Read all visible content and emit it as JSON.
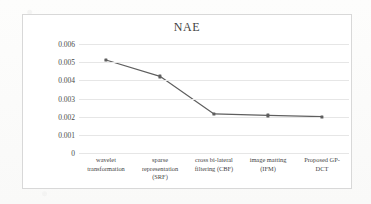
{
  "chart_data": {
    "type": "line",
    "title": "NAE",
    "xlabel": "",
    "ylabel": "",
    "categories": [
      "wavelet transformation",
      "sparse representation (SRF)",
      "cross bi-lateral filtering (CBF)",
      "image matting (IFM)",
      "Proposed GP-DCT"
    ],
    "category_lines": [
      [
        "wavelet",
        "transformation"
      ],
      [
        "sparse",
        "representation",
        "(SRF)"
      ],
      [
        "cross bi-lateral",
        "filtering (CBF)"
      ],
      [
        "image matting",
        "(IFM)"
      ],
      [
        "Proposed GP-",
        "DCT"
      ]
    ],
    "values": [
      0.00512,
      0.00422,
      0.00215,
      0.00207,
      0.002
    ],
    "ylim": [
      0,
      0.006
    ],
    "ytick_labels": [
      "0.006",
      "0.005",
      "0.004",
      "0.003",
      "0.002",
      "0.001",
      "0"
    ],
    "ytick_values": [
      0.006,
      0.005,
      0.004,
      0.003,
      0.002,
      0.001,
      0
    ],
    "grid": true,
    "legend": false,
    "legend_position": "none",
    "series_color": "#5e5e5e",
    "gridline_color": "#e6e6e6",
    "marker": "square"
  }
}
